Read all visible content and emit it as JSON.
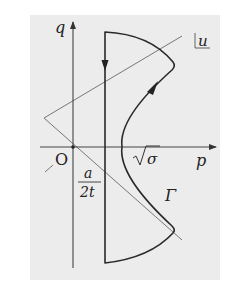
{
  "figure": {
    "background_color": "#ececec",
    "axis_color": "#444444",
    "line_color": "#666666",
    "contour_color": "#2a2a2a"
  },
  "labels": {
    "q_axis": "q",
    "p_axis": "p",
    "origin": "O",
    "u_label": "u",
    "sqrt_sigma": "√σ",
    "sigma": "σ",
    "frac_num": "a",
    "frac_den": "2t",
    "gamma": "Γ"
  }
}
